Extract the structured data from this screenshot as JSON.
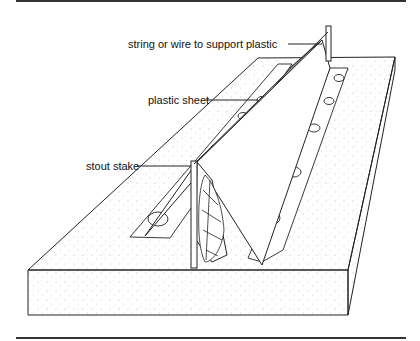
{
  "figure": {
    "labels": [
      {
        "id": "string",
        "text": "string or wire to support plastic"
      },
      {
        "id": "sheet",
        "text": "plastic sheet"
      },
      {
        "id": "stake",
        "text": "stout stake"
      }
    ]
  },
  "colors": {
    "line": "#222222",
    "background": "#ffffff"
  }
}
